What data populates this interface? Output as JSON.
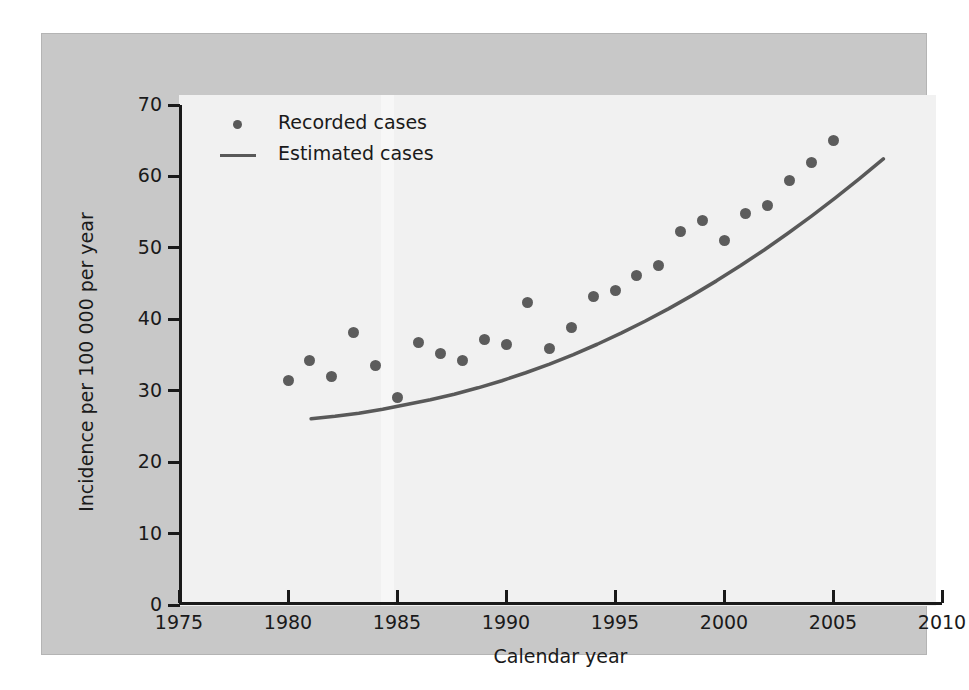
{
  "chart_data": {
    "type": "scatter",
    "title": "",
    "xlabel": "Calendar year",
    "ylabel": "Incidence per 100 000 per year",
    "xlim": [
      1975,
      2010
    ],
    "ylim": [
      0,
      70
    ],
    "xticks": [
      1975,
      1980,
      1985,
      1990,
      1995,
      2000,
      2005,
      2010
    ],
    "yticks": [
      0,
      10,
      20,
      30,
      40,
      50,
      60,
      70
    ],
    "grid": false,
    "legend_position": "top-left",
    "legend": [
      "Recorded cases",
      "Estimated cases"
    ],
    "series": [
      {
        "name": "Recorded cases",
        "type": "scatter",
        "marker": "circle",
        "color": "#5c5c5c",
        "x": [
          1980,
          1981,
          1982,
          1983,
          1984,
          1985,
          1986,
          1987,
          1988,
          1989,
          1990,
          1991,
          1992,
          1993,
          1994,
          1995,
          1996,
          1997,
          1998,
          1999,
          2000,
          2001,
          2002,
          2003,
          2004
        ],
        "values": [
          31.4,
          34.3,
          32.0,
          38.2,
          33.6,
          29.0,
          36.8,
          35.2,
          34.2,
          37.2,
          36.5,
          42.4,
          35.9,
          38.9,
          43.2,
          44.0,
          46.2,
          47.6,
          52.3,
          53.8,
          51.1,
          54.8,
          55.9,
          59.5,
          61.9
        ]
      },
      {
        "name": "Estimated cases",
        "type": "line",
        "color": "#595959",
        "x": [
          1980,
          1981,
          1982,
          1983,
          1984,
          1985,
          1986,
          1987,
          1988,
          1989,
          1990,
          1991,
          1992,
          1993,
          1994,
          1995,
          1996,
          1997,
          1998,
          1999,
          2000,
          2001,
          2002,
          2003,
          2004
        ],
        "values": [
          31.4,
          31.7,
          32.1,
          32.6,
          33.2,
          33.8,
          34.5,
          35.3,
          36.2,
          37.2,
          38.3,
          39.5,
          40.8,
          42.2,
          43.7,
          45.3,
          47.0,
          48.8,
          50.7,
          52.7,
          54.8,
          57.0,
          59.3,
          61.7,
          64.2
        ]
      }
    ],
    "extra_points": [
      {
        "x": 2005,
        "y": 65.0,
        "series": "Recorded cases"
      }
    ]
  },
  "axes": {
    "y_title": "Incidence per 100 000 per year",
    "x_title": "Calendar year",
    "y_tick_labels": [
      "70",
      "60",
      "50",
      "40",
      "30",
      "20",
      "10",
      "0"
    ],
    "x_tick_labels": [
      "1975",
      "1980",
      "1985",
      "1990",
      "1995",
      "2000",
      "2005",
      "2010"
    ]
  },
  "legend": {
    "items": [
      {
        "label": "Recorded cases",
        "key": "dot-marker"
      },
      {
        "label": "Estimated cases",
        "key": "line-marker"
      }
    ]
  },
  "colors": {
    "page_background": "#ffffff",
    "panel_background": "#c8c8c8",
    "plot_background": "#f1f1f1",
    "axis": "#1a1a1a",
    "marker": "#5c5c5c",
    "curve": "#595959",
    "text": "#1a1a1a"
  }
}
